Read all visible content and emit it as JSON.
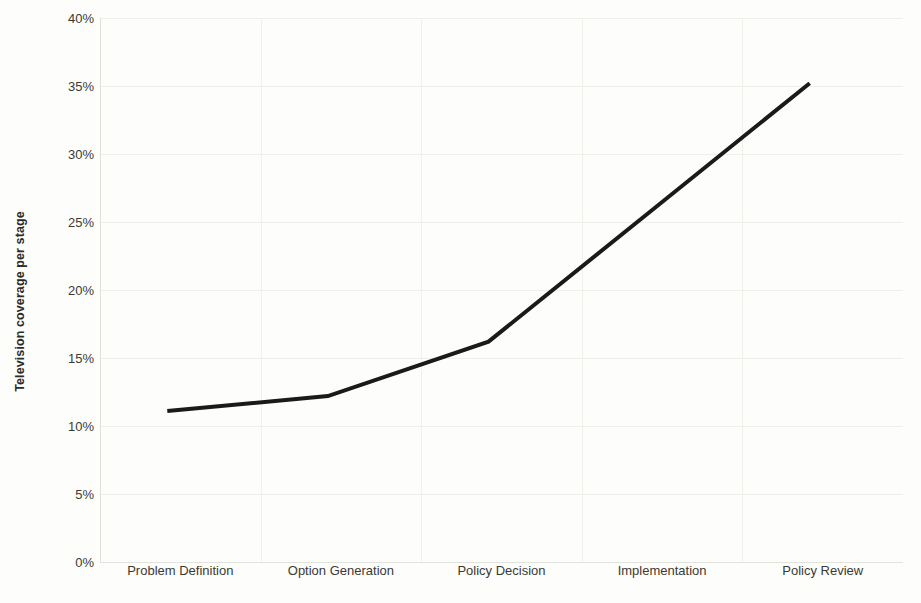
{
  "chart_data": {
    "type": "line",
    "title": "",
    "xlabel": "",
    "ylabel": "Television coverage per stage",
    "categories": [
      "Problem Definition",
      "Option Generation",
      "Policy Decision",
      "Implementation",
      "Policy Review"
    ],
    "values": [
      11.1,
      12.2,
      16.2,
      25.7,
      35.2
    ],
    "series": [
      {
        "name": "Television coverage per stage",
        "values": [
          11.1,
          12.2,
          16.2,
          25.7,
          35.2
        ]
      }
    ],
    "ylim": [
      0,
      40
    ],
    "ytick_values": [
      0,
      5,
      10,
      15,
      20,
      25,
      30,
      35,
      40
    ],
    "ytick_labels": [
      "0%",
      "5%",
      "10%",
      "15%",
      "20%",
      "25%",
      "30%",
      "35%",
      "40%"
    ],
    "grid": true,
    "legend": false,
    "legend_position": "none",
    "line_color": "#1a1a18",
    "line_width": 4,
    "markers": false,
    "background_color": "#fdfdfb",
    "grid_color": "#eeeeea",
    "text_color": "#3a3a35"
  }
}
